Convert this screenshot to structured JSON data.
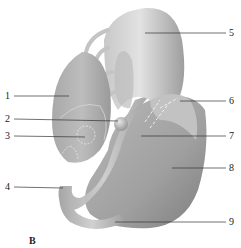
{
  "figure": {
    "panel_letter": "B",
    "background": "#ffffff",
    "structure_colors": {
      "light": "#d8d8d8",
      "mid": "#b4b4b4",
      "dark": "#8e8e8e",
      "dashed_outline": "#eeeeee"
    },
    "labels": [
      {
        "number": "1",
        "side": "left"
      },
      {
        "number": "2",
        "side": "left"
      },
      {
        "number": "3",
        "side": "left"
      },
      {
        "number": "4",
        "side": "left"
      },
      {
        "number": "5",
        "side": "right"
      },
      {
        "number": "6",
        "side": "right"
      },
      {
        "number": "7",
        "side": "right"
      },
      {
        "number": "8",
        "side": "right"
      },
      {
        "number": "9",
        "side": "right"
      }
    ]
  }
}
